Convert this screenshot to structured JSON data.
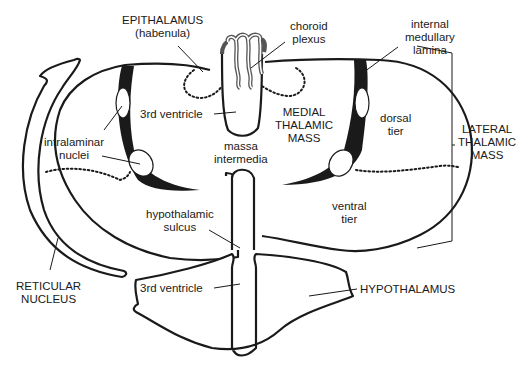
{
  "diagram": {
    "labels": {
      "epithalamus": [
        "EPITHALAMUS",
        "(habenula)"
      ],
      "choroid_plexus": [
        "choroid",
        "plexus"
      ],
      "internal_medullary_lamina": [
        "internal",
        "medullary",
        "lamina"
      ],
      "third_ventricle_upper": "3rd ventricle",
      "medial_thalamic_mass": [
        "MEDIAL",
        "THALAMIC",
        "MASS"
      ],
      "dorsal_tier": [
        "dorsal",
        "tier"
      ],
      "lateral_thalamic_mass": [
        "LATERAL",
        "THALAMIC",
        "MASS"
      ],
      "intralaminar_nuclei": [
        "intralaminar",
        "nuclei"
      ],
      "massa_intermedia": [
        "massa",
        "intermedia"
      ],
      "ventral_tier": [
        "ventral",
        "tier"
      ],
      "hypothalamic_sulcus": [
        "hypothalamic",
        "sulcus"
      ],
      "reticular_nucleus": [
        "RETICULAR",
        "NUCLEUS"
      ],
      "third_ventricle_lower": "3rd ventricle",
      "hypothalamus": "HYPOTHALAMUS"
    },
    "colors": {
      "line": "#1a1a1a",
      "plexus": "#555555",
      "background": "#ffffff"
    }
  }
}
